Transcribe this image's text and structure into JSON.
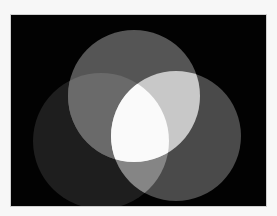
{
  "image": {
    "description": "Three overlapping grayscale circles on black background (additive light mixing)",
    "background": "#020202",
    "page_background": "#f7f7f7",
    "circles": [
      {
        "name": "top",
        "cx": 123,
        "cy": 81,
        "r": 66,
        "color": "#555555"
      },
      {
        "name": "left",
        "cx": 90,
        "cy": 126,
        "r": 68,
        "color": "#1e1e1e"
      },
      {
        "name": "right",
        "cx": 165,
        "cy": 121,
        "r": 65,
        "color": "#4a4a4a"
      }
    ],
    "overlaps": {
      "top_right": "#c8c8c8",
      "top_left": "#6a6a6a",
      "left_right": "#858585",
      "all_three": "#fafafa"
    }
  }
}
